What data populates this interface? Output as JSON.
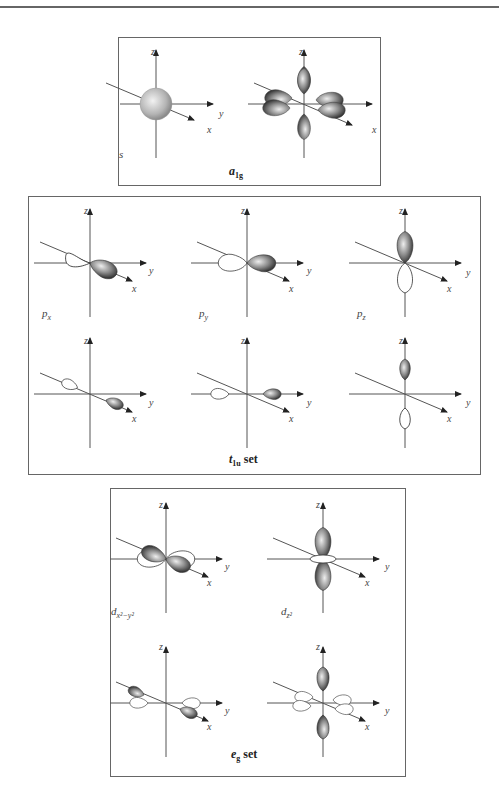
{
  "panels": [
    {
      "id": "a1g",
      "caption_symbol": "a",
      "caption_sub": "1g",
      "caption_suffix": "",
      "diagrams": [
        {
          "label": "s",
          "label_sub": "",
          "axes": [
            "z",
            "y",
            "x"
          ],
          "shape": "sphere"
        },
        {
          "label": "",
          "label_sub": "",
          "axes": [
            "z",
            "y",
            "x"
          ],
          "shape": "ligand-sigma-all-positive"
        }
      ]
    },
    {
      "id": "t1u",
      "caption_symbol": "t",
      "caption_sub": "1u",
      "caption_suffix": " set",
      "diagrams": [
        {
          "label": "p",
          "label_sub": "x",
          "axes": [
            "z",
            "y",
            "x"
          ],
          "shape": "p-orbital-x"
        },
        {
          "label": "p",
          "label_sub": "y",
          "axes": [
            "z",
            "y",
            "x"
          ],
          "shape": "p-orbital-y"
        },
        {
          "label": "p",
          "label_sub": "z",
          "axes": [
            "z",
            "y",
            "x"
          ],
          "shape": "p-orbital-z"
        },
        {
          "label": "",
          "label_sub": "",
          "axes": [
            "z",
            "y",
            "x"
          ],
          "shape": "ligand-x"
        },
        {
          "label": "",
          "label_sub": "",
          "axes": [
            "z",
            "y",
            "x"
          ],
          "shape": "ligand-y"
        },
        {
          "label": "",
          "label_sub": "",
          "axes": [
            "z",
            "y",
            "x"
          ],
          "shape": "ligand-z"
        }
      ]
    },
    {
      "id": "eg",
      "caption_symbol": "e",
      "caption_sub": "g",
      "caption_suffix": " set",
      "diagrams": [
        {
          "label": "d",
          "label_sub": "x²−y²",
          "axes": [
            "z",
            "y",
            "x"
          ],
          "shape": "d-x2-y2"
        },
        {
          "label": "d",
          "label_sub": "z²",
          "axes": [
            "z",
            "y",
            "x"
          ],
          "shape": "d-z2"
        },
        {
          "label": "",
          "label_sub": "",
          "axes": [
            "z",
            "y",
            "x"
          ],
          "shape": "ligand-x2-y2"
        },
        {
          "label": "",
          "label_sub": "",
          "axes": [
            "z",
            "y",
            "x"
          ],
          "shape": "ligand-z2"
        }
      ]
    }
  ],
  "colors": {
    "border": "#666666",
    "axis": "#555555",
    "lobe_dark": "#3a3a3a",
    "lobe_light": "#e8e8e8",
    "lobe_outline": "#333333"
  }
}
